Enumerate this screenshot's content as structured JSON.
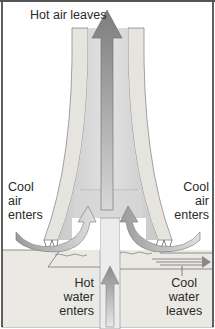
{
  "diagram": {
    "labels": {
      "hot_air_leaves": "Hot air leaves",
      "cool_air_left": [
        "Cool",
        "air",
        "enters"
      ],
      "cool_air_right": [
        "Cool",
        "air",
        "enters"
      ],
      "hot_water_enters": [
        "Hot",
        "water",
        "enters"
      ],
      "cool_water_leaves": [
        "Cool",
        "water",
        "leaves"
      ]
    },
    "colors": {
      "frame": "#2b2b2b",
      "tower_wall": "#e6e4df",
      "tower_wall_edge": "#8a8a8a",
      "inner_core": "#d4d4d4",
      "hot_air_arrow": "#8f8f8f",
      "cool_air_arrow": "#bdbdbd",
      "pond": "#ebe9e4",
      "text": "#2a2a2a"
    },
    "icons": [
      "hot-air-up-arrow",
      "cool-air-curved-arrow-left",
      "cool-air-curved-arrow-right",
      "hot-water-up-arrow",
      "cool-water-right-arrow"
    ]
  }
}
